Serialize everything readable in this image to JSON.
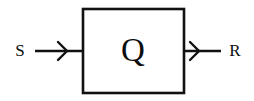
{
  "diagram": {
    "background_color": "#ffffff",
    "stroke_color": "#111111",
    "text_color": "#0d0d0d",
    "block": {
      "label": "Q",
      "shape": "square",
      "x": 83,
      "y": 9,
      "width": 101,
      "height": 84
    },
    "ports": [
      {
        "name": "input",
        "label": "S",
        "side": "left",
        "label_x": 20,
        "label_y": 51,
        "wire_x1": 35,
        "wire_x2": 83,
        "wire_y": 51,
        "arrow_tip_x": 66,
        "arrow_direction": "right"
      },
      {
        "name": "output",
        "label": "R",
        "side": "right",
        "label_x": 235,
        "label_y": 51,
        "wire_x1": 184,
        "wire_x2": 221,
        "wire_y": 51,
        "arrow_tip_x": 198,
        "arrow_direction": "right"
      }
    ]
  }
}
